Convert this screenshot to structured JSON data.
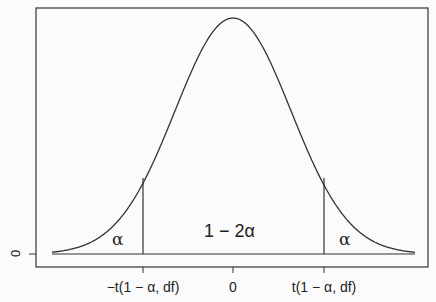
{
  "chart_data": {
    "type": "line",
    "title": "",
    "xlabel": "",
    "ylabel": "",
    "x_ticks": [
      "−t(1 − α, df)",
      "0",
      "t(1 − α, df)"
    ],
    "y_ticks": [
      "0"
    ],
    "regions": [
      {
        "name": "left-tail",
        "label": "α"
      },
      {
        "name": "center",
        "label": "1 − 2α"
      },
      {
        "name": "right-tail",
        "label": "α"
      }
    ],
    "critical_values": [
      -1,
      1
    ],
    "grid": false,
    "legend": false
  },
  "labels": {
    "left_alpha": "α",
    "center": "1 − 2α",
    "right_alpha": "α",
    "x_left": "−t(1 − α, df)",
    "x_zero": "0",
    "x_right": "t(1 − α, df)",
    "y_zero": "0"
  }
}
